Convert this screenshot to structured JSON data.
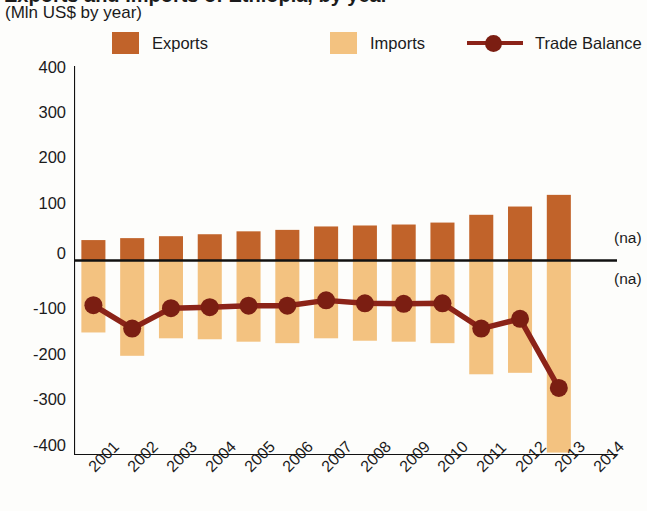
{
  "header": {
    "title": "Exports and Imports of Ethiopia, by year",
    "subtitle": "(Mln US$ by year)"
  },
  "legend": {
    "position": "top",
    "items": [
      {
        "label": "Exports",
        "color": "#C1632A",
        "marker": "square"
      },
      {
        "label": "Imports",
        "color": "#F3C280",
        "marker": "square"
      },
      {
        "label": "Trade Balance",
        "color": "#8B2318",
        "marker": "line-dot"
      }
    ]
  },
  "axes": {
    "y": {
      "ticks": [
        "400",
        "300",
        "200",
        "100",
        "0",
        "-100",
        "-200",
        "-300",
        "-400"
      ],
      "values": [
        400,
        300,
        200,
        100,
        0,
        -100,
        -200,
        -300,
        -400
      ],
      "min": -400,
      "max": 400
    },
    "x": {
      "ticks": [
        "2001",
        "2002",
        "2003",
        "2004",
        "2005",
        "2006",
        "2007",
        "2008",
        "2009",
        "2010",
        "2011",
        "2012",
        "2013",
        "2014"
      ]
    }
  },
  "annotations": {
    "na_above": "(na)",
    "na_below": "(na)"
  },
  "chart_data": {
    "type": "bar",
    "title": "Exports and Imports of Ethiopia, by year",
    "subtitle": "(Mln US$ by year)",
    "xlabel": "",
    "ylabel": "Mln US$",
    "ylim": [
      -400,
      400
    ],
    "grid": false,
    "legend_position": "top",
    "categories": [
      "2001",
      "2002",
      "2003",
      "2004",
      "2005",
      "2006",
      "2007",
      "2008",
      "2009",
      "2010",
      "2011",
      "2012",
      "2013",
      "2014"
    ],
    "series": [
      {
        "name": "Exports",
        "type": "bar",
        "color": "#C1632A",
        "values": [
          42,
          46,
          50,
          54,
          60,
          63,
          70,
          72,
          74,
          78,
          94,
          111,
          135,
          null
        ]
      },
      {
        "name": "Imports",
        "type": "bar",
        "color": "#F3C280",
        "values": [
          -148,
          -196,
          -160,
          -162,
          -167,
          -170,
          -160,
          -165,
          -167,
          -170,
          -234,
          -231,
          -395,
          null
        ]
      },
      {
        "name": "Trade Balance",
        "type": "line",
        "color": "#8B2318",
        "values": [
          -92,
          -140,
          -98,
          -96,
          -93,
          -93,
          -82,
          -88,
          -89,
          -88,
          -140,
          -120,
          -262,
          null
        ]
      }
    ],
    "notes": [
      "2014 values are not available: marked (na) above and below the zero axis."
    ]
  }
}
